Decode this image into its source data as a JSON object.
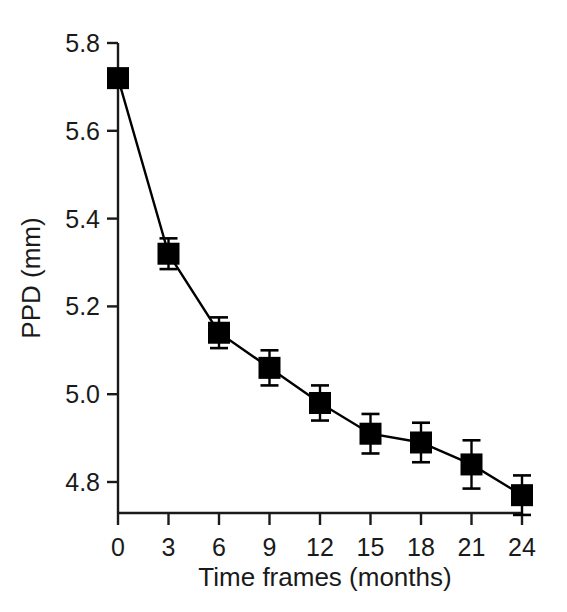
{
  "chart_data": {
    "type": "line",
    "title": "",
    "subtitle": "",
    "xlabel": "Time frames (months)",
    "ylabel": "PPD (mm)",
    "x": [
      0,
      3,
      6,
      9,
      12,
      15,
      18,
      21,
      24
    ],
    "xtick_labels": [
      "0",
      "3",
      "6",
      "9",
      "12",
      "15",
      "18",
      "21",
      "24"
    ],
    "ytick_labels": [
      "5.8",
      "5.6",
      "5.4",
      "5.2",
      "5.0",
      "4.8"
    ],
    "yticks": [
      5.8,
      5.6,
      5.4,
      5.2,
      5.0,
      4.8
    ],
    "xlim": [
      0,
      24
    ],
    "ylim": [
      4.72,
      5.82
    ],
    "grid": false,
    "legend": null,
    "marker": "filled-square",
    "line_color": "#000000",
    "marker_color": "#000000",
    "series": [
      {
        "name": "PPD",
        "values": [
          5.72,
          5.32,
          5.14,
          5.06,
          4.98,
          4.91,
          4.89,
          4.84,
          4.77
        ],
        "errors": [
          0.02,
          0.035,
          0.035,
          0.04,
          0.04,
          0.045,
          0.045,
          0.055,
          0.045
        ]
      }
    ],
    "annotations": []
  },
  "axes": {
    "y_title": "PPD (mm)",
    "x_title": "Time frames (months)"
  }
}
